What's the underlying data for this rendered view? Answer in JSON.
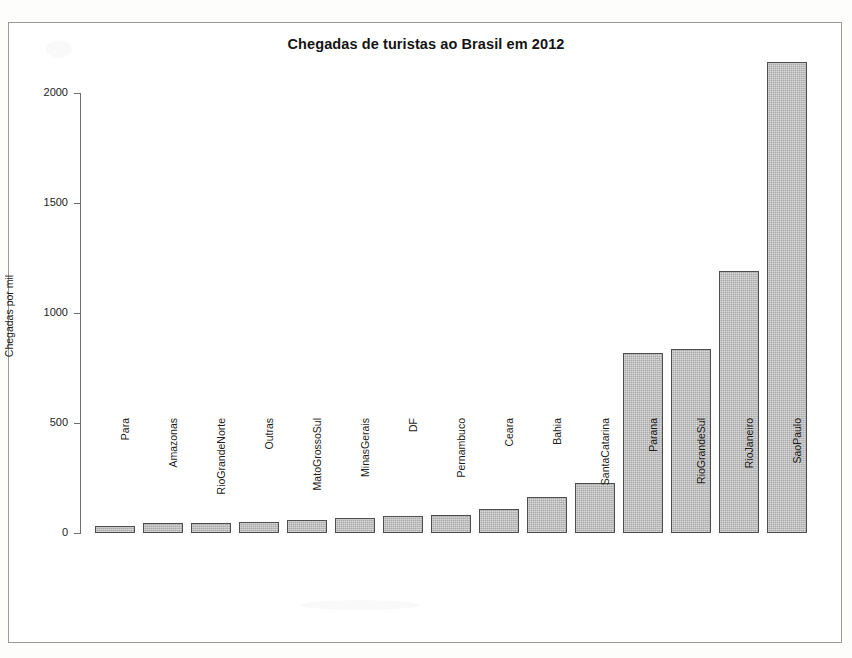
{
  "chart_data": {
    "type": "bar",
    "title": "Chegadas de turistas ao Brasil em 2012",
    "xlabel": "",
    "ylabel": "Chegadas por mil",
    "ylim": [
      0,
      2200
    ],
    "yticks": [
      0,
      500,
      1000,
      1500,
      2000
    ],
    "ytick_labels": [
      "0",
      "500",
      "1000",
      "1500",
      "2000"
    ],
    "grid": false,
    "legend": false,
    "bar_fill_color": "#b9b9b9",
    "bar_border_color": "#4e4e4e",
    "categories": [
      "Para",
      "Amazonas",
      "RioGrandeNorte",
      "Outras",
      "MatoGrossoSul",
      "MinasGerais",
      "DF",
      "Pernambuco",
      "Ceara",
      "Bahia",
      "SantaCatarina",
      "Parana",
      "RioGrandeSul",
      "RioJaneiro",
      "SaoPaulo"
    ],
    "values": [
      32,
      45,
      46,
      48,
      59,
      68,
      77,
      82,
      109,
      164,
      227,
      818,
      836,
      1192,
      2140
    ]
  }
}
